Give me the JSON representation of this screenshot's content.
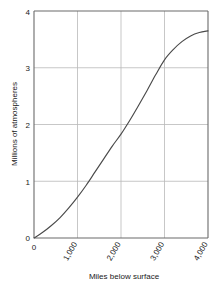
{
  "chart_data": {
    "type": "line",
    "title": "",
    "subtitle": "",
    "xlabel": "Miles below surface",
    "ylabel": "Millions of atmospheres",
    "xlim": [
      0,
      4000
    ],
    "ylim": [
      0,
      4
    ],
    "grid": true,
    "legend": "none",
    "x_tick_labels": [
      "0",
      "1,000",
      "2,000",
      "3,000",
      "4,000"
    ],
    "x_tick_values": [
      0,
      1000,
      2000,
      3000,
      4000
    ],
    "y_tick_labels": [
      "0",
      "1",
      "2",
      "3",
      "4"
    ],
    "y_tick_values": [
      0,
      1,
      2,
      3,
      4
    ],
    "x": [
      0,
      200,
      400,
      600,
      800,
      1000,
      1200,
      1400,
      1600,
      1800,
      2000,
      2200,
      2400,
      2600,
      2800,
      3000,
      3200,
      3400,
      3600,
      3800,
      4000
    ],
    "values": [
      0.0,
      0.1,
      0.22,
      0.36,
      0.53,
      0.72,
      0.93,
      1.16,
      1.39,
      1.62,
      1.83,
      2.07,
      2.33,
      2.6,
      2.88,
      3.14,
      3.32,
      3.46,
      3.56,
      3.62,
      3.65
    ],
    "series": [
      {
        "name": "Pressure vs depth",
        "values": [
          0.0,
          0.1,
          0.22,
          0.36,
          0.53,
          0.72,
          0.93,
          1.16,
          1.39,
          1.62,
          1.83,
          2.07,
          2.33,
          2.6,
          2.88,
          3.14,
          3.32,
          3.46,
          3.56,
          3.62,
          3.65
        ],
        "color": "#4a4a4a"
      }
    ],
    "colors": {
      "curve": "#4a4a4a",
      "grid": "#b9b9b9",
      "axis": "#6b6b6b",
      "background": "#ffffff",
      "text": "#1a1a1a"
    }
  }
}
